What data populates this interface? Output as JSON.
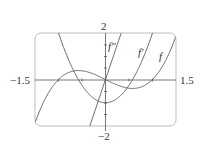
{
  "chart_data": {
    "type": "line",
    "title": "",
    "xlabel": "",
    "ylabel": "",
    "xlim": [
      -1.5,
      1.5
    ],
    "ylim": [
      -2,
      2
    ],
    "grid": false,
    "tick_labels": {
      "x_left": "−1.5",
      "x_right": "1.5",
      "y_top": "2",
      "y_bottom": "−2"
    },
    "series": [
      {
        "name": "f",
        "label": "f",
        "expression": "x^3 - x",
        "x": [
          -1.5,
          -1.0,
          -0.577,
          0,
          0.577,
          1.0,
          1.5
        ],
        "values": [
          -1.875,
          0,
          0.385,
          0,
          -0.385,
          0,
          1.875
        ]
      },
      {
        "name": "f'",
        "label": "f′",
        "expression": "3x^2 - 1",
        "x": [
          -1.5,
          -1.0,
          -0.577,
          0,
          0.577,
          1.0,
          1.5
        ],
        "values": [
          5.75,
          2,
          0,
          -1,
          0,
          2,
          5.75
        ]
      },
      {
        "name": "f''",
        "label": "f″",
        "expression": "6x",
        "x": [
          -1.5,
          -0.333,
          0,
          0.333,
          1.5
        ],
        "values": [
          -9,
          -2,
          0,
          2,
          9
        ]
      }
    ]
  }
}
